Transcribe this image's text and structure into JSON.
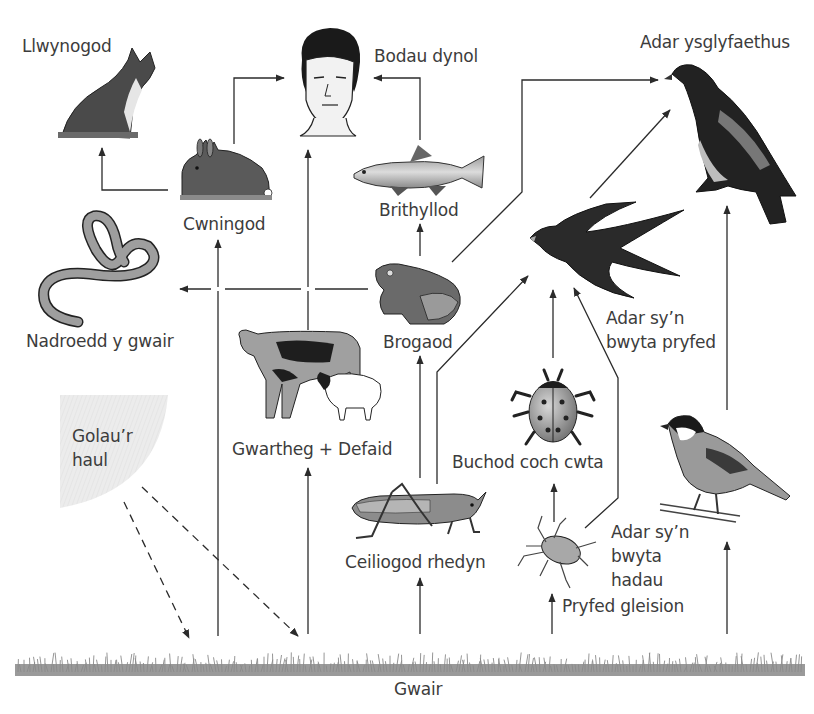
{
  "diagram": {
    "type": "food-web",
    "language": "Welsh",
    "organisms": {
      "fox": {
        "label": "Llwynogod",
        "icon": "fox-icon"
      },
      "human": {
        "label": "Bodau dynol",
        "icon": "human-face-icon"
      },
      "bird_of_prey": {
        "label": "Adar ysglyfaethus",
        "icon": "hawk-icon"
      },
      "rabbit": {
        "label": "Cwningod",
        "icon": "rabbit-icon"
      },
      "trout": {
        "label": "Brithyllod",
        "icon": "trout-icon"
      },
      "snake": {
        "label": "Nadroedd y gwair",
        "icon": "grass-snake-icon"
      },
      "frog": {
        "label": "Brogaod",
        "icon": "frog-icon"
      },
      "insect_bird": {
        "label_line1": "Adar sy’n",
        "label_line2": "bwyta pryfed",
        "icon": "swallow-icon"
      },
      "cattle_sheep": {
        "label": "Gwartheg + Defaid",
        "icon": "cow-and-sheep-icon"
      },
      "ladybird": {
        "label": "Buchod coch cwta",
        "icon": "ladybird-icon"
      },
      "sun": {
        "label_line1": "Golau’r",
        "label_line2": "haul",
        "icon": "sunlight-icon"
      },
      "grasshopper": {
        "label": "Ceiliogod rhedyn",
        "icon": "grasshopper-icon"
      },
      "seed_bird": {
        "label_line1": "Adar sy’n",
        "label_line2": "bwyta",
        "label_line3": "hadau",
        "icon": "great-tit-icon"
      },
      "aphid": {
        "label": "Pryfed gleision",
        "icon": "aphid-icon"
      },
      "grass": {
        "label": "Gwair",
        "icon": "grass-icon"
      }
    },
    "energy_flows": [
      {
        "from": "Golau’r haul",
        "to": "Gwair",
        "style": "dashed"
      },
      {
        "from": "Golau’r haul",
        "to": "Gwair",
        "style": "dashed"
      },
      {
        "from": "Gwair",
        "to": "Cwningod"
      },
      {
        "from": "Gwair",
        "to": "Gwartheg + Defaid"
      },
      {
        "from": "Gwair",
        "to": "Ceiliogod rhedyn"
      },
      {
        "from": "Gwair",
        "to": "Pryfed gleision"
      },
      {
        "from": "Gwair",
        "to": "Adar sy’n bwyta hadau"
      },
      {
        "from": "Cwningod",
        "to": "Llwynogod"
      },
      {
        "from": "Cwningod",
        "to": "Bodau dynol"
      },
      {
        "from": "Gwartheg + Defaid",
        "to": "Bodau dynol"
      },
      {
        "from": "Brithyllod",
        "to": "Bodau dynol"
      },
      {
        "from": "Brogaod",
        "to": "Brithyllod"
      },
      {
        "from": "Brogaod",
        "to": "Nadroedd y gwair"
      },
      {
        "from": "Brogaod",
        "to": "Adar ysglyfaethus"
      },
      {
        "from": "Ceiliogod rhedyn",
        "to": "Brogaod"
      },
      {
        "from": "Ceiliogod rhedyn",
        "to": "Adar sy’n bwyta pryfed"
      },
      {
        "from": "Buchod coch cwta",
        "to": "Adar sy’n bwyta pryfed"
      },
      {
        "from": "Pryfed gleision",
        "to": "Buchod coch cwta"
      },
      {
        "from": "Pryfed gleision",
        "to": "Adar sy’n bwyta pryfed"
      },
      {
        "from": "Adar sy’n bwyta pryfed",
        "to": "Adar ysglyfaethus"
      },
      {
        "from": "Adar sy’n bwyta hadau",
        "to": "Adar ysglyfaethus"
      }
    ],
    "colors": {
      "line": "#2b2b2b",
      "label_text": "#3c3c3c",
      "sun_patch": "#e8e8e8",
      "grass": "#8a8a8a"
    }
  }
}
